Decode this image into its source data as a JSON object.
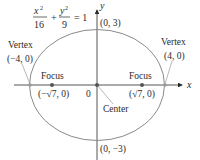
{
  "equation": {
    "x_num": "x",
    "x_den": "16",
    "y_num": "y",
    "y_den": "9",
    "exp": "2",
    "plus": "+",
    "equals": "= 1"
  },
  "axes": {
    "x_label": "x",
    "y_label": "y",
    "origin_label": "0"
  },
  "ellipse": {
    "a": 4,
    "b": 3,
    "c_label": "√7",
    "color": "#8a8a8a",
    "point_color": "#555555"
  },
  "labels": {
    "vertex_left_title": "Vertex",
    "vertex_left_coords": "(−4, 0)",
    "vertex_right_title": "Vertex",
    "vertex_right_coords": "(4, 0)",
    "focus_left_title": "Focus",
    "focus_left_coords": "(−√7, 0)",
    "focus_right_title": "Focus",
    "focus_right_coords": "(√7, 0)",
    "center": "Center",
    "top": "(0, 3)",
    "bottom": "(0, −3)"
  }
}
